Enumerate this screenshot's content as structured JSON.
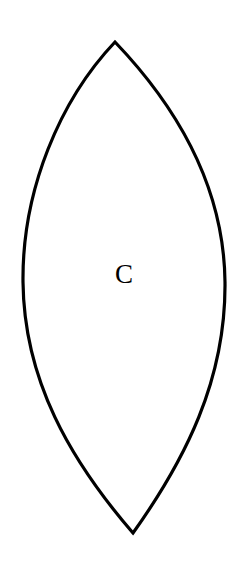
{
  "diagram": {
    "shape": "lens",
    "label": "C",
    "stroke_color": "#000000",
    "fill_color": "#ffffff",
    "background": "#ffffff"
  }
}
